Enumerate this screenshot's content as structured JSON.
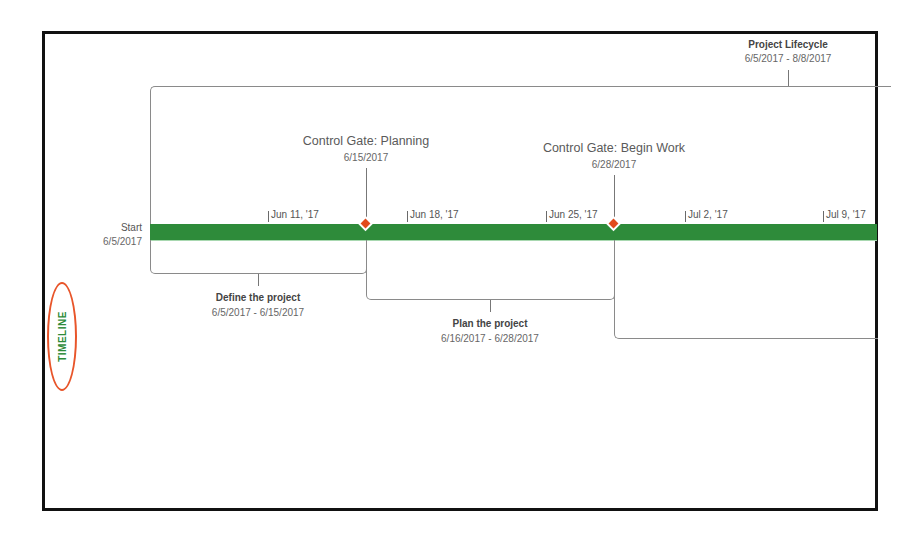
{
  "view": {
    "side_tab_label": "TIMELINE",
    "accent_color": "#2e8b3a",
    "highlight_ring_color": "#e8552a",
    "milestone_color": "#e24a1c"
  },
  "summary_task": {
    "title": "Project Lifecycle",
    "dates": "6/5/2017 - 8/8/2017"
  },
  "start": {
    "label": "Start",
    "date": "6/5/2017"
  },
  "timescale": {
    "ticks": [
      "Jun 11, '17",
      "Jun 18, '17",
      "Jun 25, '17",
      "Jul 2, '17",
      "Jul 9, '17"
    ]
  },
  "milestones": [
    {
      "title": "Control Gate: Planning",
      "date": "6/15/2017"
    },
    {
      "title": "Control Gate: Begin Work",
      "date": "6/28/2017"
    }
  ],
  "tasks": [
    {
      "title": "Define the project",
      "dates": "6/5/2017 - 6/15/2017"
    },
    {
      "title": "Plan the project",
      "dates": "6/16/2017 - 6/28/2017"
    }
  ]
}
